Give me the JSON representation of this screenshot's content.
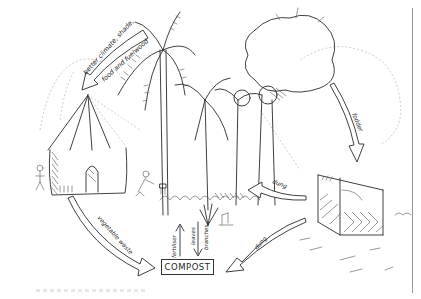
{
  "diagram": {
    "title": "",
    "type": "hand-drawn homestead nutrient cycle sketch",
    "nodes": [
      {
        "id": "trees",
        "label": "trees (palms and shade trees)"
      },
      {
        "id": "house",
        "label": "thatched hut"
      },
      {
        "id": "livestock-pen",
        "label": "fenced livestock enclosure"
      },
      {
        "id": "garden",
        "label": "garden plants"
      },
      {
        "id": "compost",
        "label": "COMPOST"
      }
    ],
    "labels": {
      "trees_to_house_line1": "better climate, shade,",
      "trees_to_house_line2": "food and fuelwood",
      "trees_to_pen": "fodder",
      "pen_to_garden": "dung",
      "pen_to_compost": "dung",
      "house_to_compost": "vegetable waste",
      "compost_to_garden": "fertiliser",
      "garden_to_compost_line1": "leaves",
      "garden_to_compost_line2": "branches",
      "compost": "COMPOST"
    },
    "edges": [
      {
        "from": "trees",
        "to": "house",
        "label": "better climate, shade, food and fuelwood"
      },
      {
        "from": "trees",
        "to": "livestock-pen",
        "label": "fodder"
      },
      {
        "from": "livestock-pen",
        "to": "garden",
        "label": "dung"
      },
      {
        "from": "livestock-pen",
        "to": "compost",
        "label": "dung"
      },
      {
        "from": "house",
        "to": "compost",
        "label": "vegetable waste"
      },
      {
        "from": "compost",
        "to": "garden",
        "label": "fertiliser"
      },
      {
        "from": "garden",
        "to": "compost",
        "label": "leaves branches"
      }
    ]
  }
}
